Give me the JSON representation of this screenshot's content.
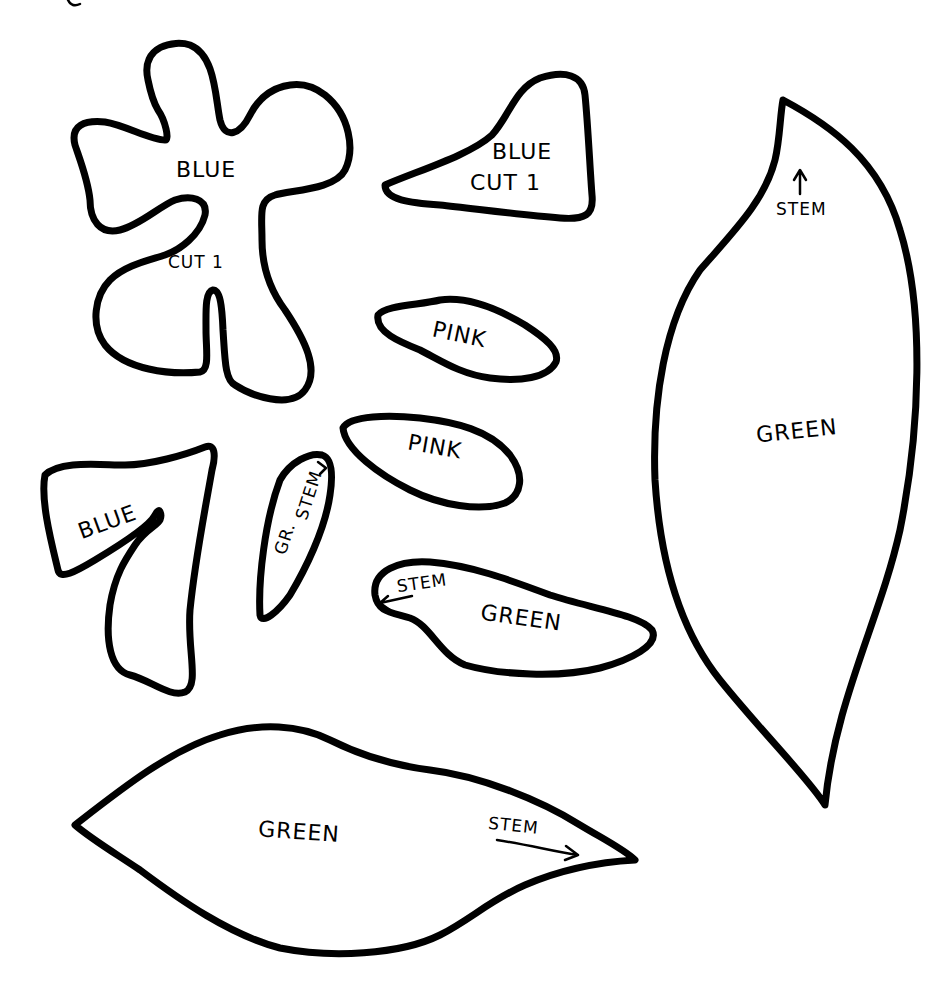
{
  "page": {
    "background": "#ffffff",
    "line_color": "#000000"
  },
  "pieces": [
    {
      "id": "flower",
      "labels": [
        "BLUE",
        "CUT 1"
      ]
    },
    {
      "id": "triangle-petal",
      "labels": [
        "BLUE",
        "CUT 1"
      ]
    },
    {
      "id": "pink-petal-1",
      "labels": [
        "PINK"
      ]
    },
    {
      "id": "pink-petal-2",
      "labels": [
        "PINK"
      ]
    },
    {
      "id": "blue-seven",
      "labels": [
        "BLUE"
      ]
    },
    {
      "id": "small-stem-leaf",
      "labels": [
        "STEM",
        "GR."
      ]
    },
    {
      "id": "green-leaf-small",
      "labels": [
        "STEM",
        "GREEN"
      ]
    },
    {
      "id": "green-leaf-tall",
      "labels": [
        "STEM",
        "GREEN"
      ]
    },
    {
      "id": "green-leaf-wide",
      "labels": [
        "GREEN",
        "STEM"
      ]
    }
  ]
}
